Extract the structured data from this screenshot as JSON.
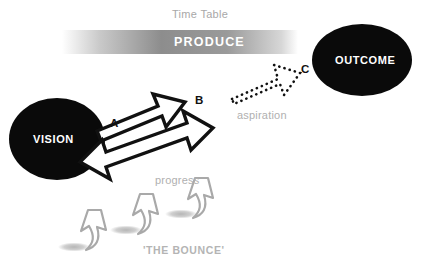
{
  "diagram": {
    "title_label": "Time Table",
    "band": {
      "label": "PRODUCE",
      "gradient_from": "#ffffff",
      "gradient_mid": "#8d8d8d",
      "gradient_to": "#ffffff"
    },
    "nodes": [
      {
        "id": "vision",
        "label": "VISION",
        "shape": "ellipse",
        "fill": "#0a0a0a",
        "text_color": "#ffffff"
      },
      {
        "id": "outcome",
        "label": "OUTCOME",
        "shape": "ellipse",
        "fill": "#0a0a0a",
        "text_color": "#ffffff"
      }
    ],
    "keypoints": [
      {
        "id": "a",
        "label": "A",
        "color": "#111111"
      },
      {
        "id": "b",
        "label": "B",
        "color": "#111111"
      },
      {
        "id": "c",
        "label": "C",
        "color": "#111111"
      }
    ],
    "annotations": [
      {
        "id": "aspiration",
        "label": "aspiration",
        "color": "#b0b0b0",
        "style": "dotted-arrow"
      },
      {
        "id": "progress",
        "label": "progress",
        "color": "#b0b0b0",
        "style": "double-headed-arrow"
      },
      {
        "id": "bounce",
        "label": "'THE BOUNCE'",
        "color": "#b4b4b4",
        "style": "rising-arrows"
      }
    ],
    "arrows": [
      {
        "id": "vision-to-b",
        "from": "vision",
        "to": "b",
        "style": "outline-block",
        "direction": "single",
        "stroke": "#111111",
        "fill": "#ffffff"
      },
      {
        "id": "progress-arrow",
        "from": "vision",
        "to": "b",
        "style": "outline-block",
        "direction": "double",
        "stroke": "#111111",
        "fill": "#ffffff"
      },
      {
        "id": "aspiration-arrow",
        "from": "b",
        "to": "outcome",
        "style": "dotted-outline",
        "direction": "single",
        "stroke": "#111111",
        "fill": "#ffffff"
      }
    ],
    "bounce_arrows": {
      "count": 3,
      "stroke": "#a9a9a9",
      "fill": "#ffffff",
      "shadow": "#c9c9c9"
    }
  }
}
